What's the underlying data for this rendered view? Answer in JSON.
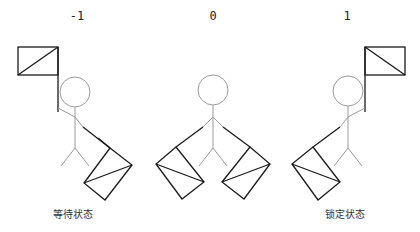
{
  "figures": [
    {
      "value_label": "-1",
      "caption": "等待状态",
      "state": "waiting",
      "flag_side": "left"
    },
    {
      "value_label": "0",
      "caption": "",
      "state": "neutral",
      "flag_side": "none"
    },
    {
      "value_label": "1",
      "caption": "锁定状态",
      "state": "locked",
      "flag_side": "right"
    }
  ],
  "colors": {
    "background": "#ffffff",
    "outline": "#1a1a1a",
    "figure": "#9a9a9a",
    "text": "#222222"
  }
}
